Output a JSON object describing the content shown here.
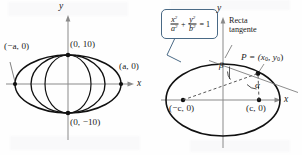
{
  "figure": {
    "panels": [
      {
        "id": "left",
        "name": "family-of-ellipses",
        "axis": {
          "x_label": "x",
          "y_label": "y"
        },
        "point_labels": [
          {
            "name": "vertex-left",
            "text": "(−a, 0)"
          },
          {
            "name": "vertex-right",
            "text": "(a, 0)"
          },
          {
            "name": "co-vertex-top",
            "text": "(0, 10)"
          },
          {
            "name": "co-vertex-bottom",
            "text": "(0, −10)"
          }
        ]
      },
      {
        "id": "right",
        "name": "ellipse-with-tangent",
        "axis": {
          "x_label": "x",
          "y_label": "y"
        },
        "equation": {
          "name": "ellipse-equation",
          "plain": "x^2/a^2 + y^2/b^2 = 1",
          "num1": "x",
          "den1": "a",
          "num2": "y",
          "den2": "b",
          "exp": "2",
          "plus": "+",
          "equals": "= 1"
        },
        "tangent_label": {
          "line1": "Recta",
          "line2": "tangente"
        },
        "point_labels": [
          {
            "name": "point-p",
            "text_main": "P = (x",
            "sub1": "0",
            "mid": ", y",
            "sub2": "0",
            "close": ")"
          },
          {
            "name": "focus-left",
            "text": "(−c, 0)"
          },
          {
            "name": "focus-right",
            "text": "(c, 0)"
          }
        ],
        "angles": [
          {
            "name": "angle-beta",
            "symbol": "β"
          },
          {
            "name": "angle-alpha",
            "symbol": "α"
          }
        ]
      }
    ],
    "colors": {
      "curve": "#111111",
      "axis": "#8a8a8a",
      "callout_border": "#4a6a86",
      "dashed": "#555555",
      "tangent": "#777777",
      "background": "#fefefe"
    }
  }
}
